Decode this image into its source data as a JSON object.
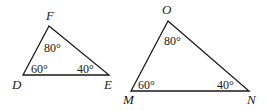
{
  "figure": {
    "triangles": [
      {
        "name": "DEF",
        "vertices": [
          {
            "label": "F",
            "angle": "80°"
          },
          {
            "label": "D",
            "angle": "60°"
          },
          {
            "label": "E",
            "angle": "40°"
          }
        ]
      },
      {
        "name": "MNO",
        "vertices": [
          {
            "label": "O",
            "angle": "80°"
          },
          {
            "label": "M",
            "angle": "60°"
          },
          {
            "label": "N",
            "angle": "40°"
          }
        ]
      }
    ]
  }
}
